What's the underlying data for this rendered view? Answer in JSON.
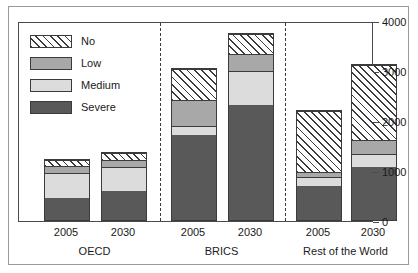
{
  "chart_data": {
    "type": "bar",
    "subtype": "stacked",
    "title": "",
    "xlabel": "",
    "ylabel": "",
    "ylim": [
      0,
      4000
    ],
    "yticks": [
      0,
      1000,
      2000,
      3000,
      4000
    ],
    "ytick_labels": [
      "0",
      "1000",
      "2000",
      "3000",
      "4000"
    ],
    "grid": false,
    "legend_position": "top-left",
    "categories": [
      "2005",
      "2030",
      "2005",
      "2030",
      "2005",
      "2030"
    ],
    "groups": [
      {
        "label": "OECD",
        "years": [
          "2005",
          "2030"
        ]
      },
      {
        "label": "BRICS",
        "years": [
          "2005",
          "2030"
        ]
      },
      {
        "label": "Rest of the World",
        "years": [
          "2005",
          "2030"
        ]
      }
    ],
    "series": [
      {
        "name": "Severe",
        "color": "#595959",
        "values": [
          460,
          600,
          1730,
          2330,
          690,
          1080
        ]
      },
      {
        "name": "Medium",
        "color": "#dcdcdc",
        "values": [
          520,
          490,
          180,
          680,
          180,
          250
        ]
      },
      {
        "name": "Low",
        "color": "#a8a8a8",
        "values": [
          130,
          140,
          530,
          350,
          110,
          300
        ]
      },
      {
        "name": "No",
        "color": "hatch",
        "values": [
          140,
          150,
          630,
          400,
          1240,
          1520
        ]
      }
    ],
    "totals": [
      1250,
      1380,
      3070,
      3760,
      2220,
      3150
    ]
  },
  "legend": {
    "items": [
      {
        "label": "No",
        "swatch": "diagonal-hatch"
      },
      {
        "label": "Low",
        "swatch": "medium-gray"
      },
      {
        "label": "Medium",
        "swatch": "light-gray"
      },
      {
        "label": "Severe",
        "swatch": "dark-gray"
      }
    ]
  },
  "axis": {
    "right_ticks": [
      "4000",
      "3000",
      "2000",
      "1000",
      "0"
    ]
  },
  "colors": {
    "severe": "#595959",
    "medium": "#dcdcdc",
    "low": "#a8a8a8",
    "outline": "#3b3b3b",
    "frame": "#4a4a4a",
    "divider": "#3a3a3a"
  }
}
